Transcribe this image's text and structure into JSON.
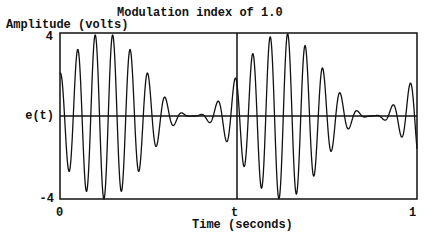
{
  "chart_data": {
    "type": "line",
    "title": "Modulation index of 1.0",
    "xlabel": "Time (seconds)",
    "ylabel": "Amplitude (volts)",
    "ylim": [
      -4,
      4
    ],
    "xlim": [
      0,
      1
    ],
    "x_ticks": [
      "0",
      "t",
      "1"
    ],
    "y_ticks": [
      "4",
      "e(t)",
      "-4"
    ],
    "grid": false,
    "legend": null,
    "annotations": [
      "vertical marker line at t (x≈0.5)",
      "horizontal zero line at e(t)"
    ],
    "series": [
      {
        "name": "e(t) AM waveform",
        "description": "Amplitude-modulated carrier, modulation index 1.0; envelope varies 0 to 4 V",
        "peak_amplitude": 4,
        "modulation_index": 1.0,
        "envelope_periods": 2,
        "envelope_max_t": 0.123,
        "carrier_cycles": 20.4,
        "carrier_phase_at_envelope_max": "trough",
        "sample_points": [
          {
            "t": 0.0,
            "v": 1.8
          },
          {
            "t": 0.05,
            "v": 3.0
          },
          {
            "t": 0.098,
            "v": 3.8
          },
          {
            "t": 0.123,
            "v": -4.0
          },
          {
            "t": 0.148,
            "v": 3.8
          },
          {
            "t": 0.197,
            "v": 3.0
          },
          {
            "t": 0.246,
            "v": 1.6
          },
          {
            "t": 0.295,
            "v": 0.7
          },
          {
            "t": 0.373,
            "v": 0.0
          },
          {
            "t": 0.45,
            "v": 0.7
          },
          {
            "t": 0.5,
            "v": 1.8
          },
          {
            "t": 0.623,
            "v": -4.0
          },
          {
            "t": 0.873,
            "v": 0.0
          },
          {
            "t": 1.0,
            "v": 1.8
          }
        ]
      }
    ]
  },
  "plot": {
    "frame": {
      "x": 60,
      "y": 33,
      "width": 357,
      "height": 166
    },
    "marker_x": 237,
    "line_color": "#111111",
    "background": "#ffffff"
  }
}
